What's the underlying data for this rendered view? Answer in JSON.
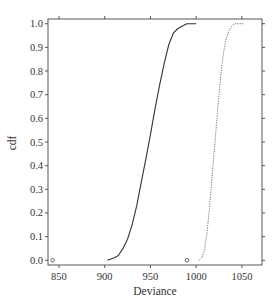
{
  "chart_data": {
    "type": "line",
    "title": "",
    "xlabel": "Deviance",
    "ylabel": "cdf",
    "xlim": [
      838,
      1072
    ],
    "ylim": [
      -0.02,
      1.02
    ],
    "x_ticks": [
      850,
      900,
      950,
      1000,
      1050
    ],
    "y_ticks": [
      0.0,
      0.1,
      0.2,
      0.3,
      0.4,
      0.5,
      0.6,
      0.7,
      0.8,
      0.9,
      1.0
    ],
    "y_tick_labels": [
      "0.0",
      "0.1",
      "0.2",
      "0.3",
      "0.4",
      "0.5",
      "0.6",
      "0.7",
      "0.8",
      "0.9",
      "1.0"
    ],
    "grid": false,
    "legend": null,
    "series": [
      {
        "name": "solid",
        "style": "solid",
        "color": "#333333",
        "x": [
          903,
          910,
          915,
          920,
          925,
          930,
          935,
          940,
          945,
          950,
          955,
          960,
          965,
          970,
          975,
          980,
          985,
          990,
          995,
          1000
        ],
        "y": [
          0.0,
          0.01,
          0.02,
          0.05,
          0.09,
          0.15,
          0.23,
          0.33,
          0.43,
          0.53,
          0.64,
          0.74,
          0.83,
          0.91,
          0.96,
          0.98,
          0.99,
          1.0,
          1.0,
          1.0
        ]
      },
      {
        "name": "dotted",
        "style": "dotted",
        "color": "#777777",
        "x": [
          1003,
          1006,
          1009,
          1012,
          1015,
          1018,
          1021,
          1024,
          1027,
          1030,
          1033,
          1036,
          1039,
          1042,
          1046,
          1052
        ],
        "y": [
          0.0,
          0.01,
          0.04,
          0.12,
          0.24,
          0.38,
          0.52,
          0.66,
          0.78,
          0.88,
          0.94,
          0.97,
          0.99,
          1.0,
          1.0,
          1.0
        ]
      }
    ],
    "markers": [
      {
        "x": 843,
        "y": 0.0,
        "shape": "open-circle"
      },
      {
        "x": 990,
        "y": 0.0,
        "shape": "open-circle"
      }
    ]
  }
}
